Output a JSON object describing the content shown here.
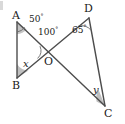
{
  "figure": {
    "kind": "geometry-diagram",
    "stroke_color": "#4d4d4d",
    "wedge_fill": "#b0b0b0",
    "background": "#ffffff",
    "width": 125,
    "height": 124
  },
  "points": {
    "A": {
      "label": "A",
      "x": 17,
      "y": 22,
      "label_x": 12,
      "label_y": 10
    },
    "B": {
      "label": "B",
      "x": 17,
      "y": 78,
      "label_x": 12,
      "label_y": 80
    },
    "C": {
      "label": "C",
      "x": 105,
      "y": 106,
      "label_x": 104,
      "label_y": 108
    },
    "D": {
      "label": "D",
      "x": 89,
      "y": 18,
      "label_x": 84,
      "label_y": 4
    },
    "O": {
      "label": "O",
      "x": 48,
      "y": 54,
      "label_x": 44,
      "label_y": 56
    }
  },
  "segments": [
    {
      "name": "AB",
      "from": "A",
      "to": "B"
    },
    {
      "name": "AC",
      "from": "A",
      "to": "C"
    },
    {
      "name": "BD",
      "from": "B",
      "to": "D"
    },
    {
      "name": "DC",
      "from": "D",
      "to": "C"
    }
  ],
  "angles": [
    {
      "name": "angle-at-A",
      "vertex": "A",
      "value": "50",
      "unit": "°",
      "label_x": 29,
      "label_y": 14
    },
    {
      "name": "angle-at-O",
      "vertex": "O",
      "value": "100",
      "unit": "°",
      "label_x": 38,
      "label_y": 27
    },
    {
      "name": "angle-at-D",
      "vertex": "D",
      "value": "65",
      "unit": "°",
      "label_x": 72,
      "label_y": 25
    },
    {
      "name": "angle-at-B",
      "vertex": "B",
      "value": "x",
      "unit": "",
      "label_x": 23,
      "label_y": 60
    },
    {
      "name": "angle-at-C",
      "vertex": "C",
      "value": "y",
      "unit": "",
      "label_x": 93,
      "label_y": 86
    }
  ],
  "corner_artifact": {
    "name": "scan-artifact",
    "visible": true
  }
}
